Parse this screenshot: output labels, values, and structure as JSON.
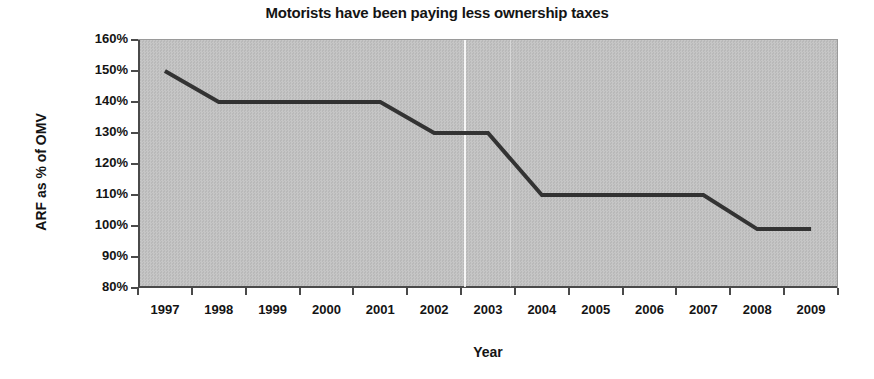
{
  "chart_data": {
    "type": "line",
    "title": "Motorists have been paying less ownership taxes",
    "xlabel": "Year",
    "ylabel": "ARF as % of OMV",
    "categories": [
      "1997",
      "1998",
      "1999",
      "2000",
      "2001",
      "2002",
      "2003",
      "2004",
      "2005",
      "2006",
      "2007",
      "2008",
      "2009"
    ],
    "values": [
      150,
      140,
      140,
      140,
      140,
      130,
      130,
      110,
      110,
      110,
      110,
      99,
      99
    ],
    "value_unit": "%",
    "ylim": [
      80,
      160
    ],
    "ytick_step": 10,
    "ytick_labels": [
      "160%",
      "150%",
      "140%",
      "130%",
      "120%",
      "110%",
      "100%",
      "90%",
      "80%"
    ],
    "ytick_values": [
      160,
      150,
      140,
      130,
      120,
      110,
      100,
      90,
      80
    ],
    "grid": false,
    "legend": "none",
    "series_color": "#333333",
    "plot_background": "#c0c0c0",
    "page_background": "#ffffff",
    "text_color": "#141414"
  }
}
